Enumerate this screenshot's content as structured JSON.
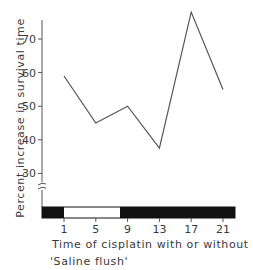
{
  "chart_data": {
    "type": "line",
    "title": "",
    "xlabel": "Time of cisplatin with or without 'Saline flush'",
    "xlabel_lines": [
      "Time of cisplatin with or without",
      "'Saline flush'"
    ],
    "ylabel": "Percent increase in survival time",
    "x": [
      1,
      5,
      9,
      13,
      17,
      21
    ],
    "categories": [
      "1",
      "5",
      "9",
      "13",
      "17",
      "21"
    ],
    "series": [
      {
        "name": "Percent increase in survival time",
        "values": [
          59,
          45,
          50,
          37.5,
          78,
          55
        ]
      }
    ],
    "yticks": [
      30,
      40,
      50,
      60,
      70
    ],
    "xticks": [
      1,
      5,
      9,
      13,
      17,
      21
    ],
    "ylim": [
      22,
      78
    ],
    "axis_break": true,
    "grid": false,
    "legend": "none",
    "light_dark_bar": [
      {
        "state": "dark",
        "from": "start",
        "to": 1
      },
      {
        "state": "light",
        "from": 1,
        "to": 8.2
      },
      {
        "state": "dark",
        "from": 8.2,
        "to": "end"
      }
    ],
    "colors": {
      "line": "#555555",
      "axis": "#555555",
      "dark_bar": "#111111",
      "light_bar": "#ffffff"
    }
  }
}
